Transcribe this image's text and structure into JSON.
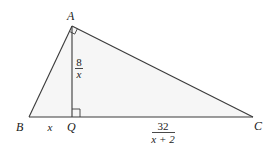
{
  "figure": {
    "type": "right-triangle-with-altitude",
    "vertices": {
      "A": "A",
      "B": "B",
      "C": "C",
      "Q": "Q"
    },
    "segment_labels": {
      "AQ": {
        "numerator": "8",
        "denominator": "x"
      },
      "BQ": "x",
      "QC": {
        "numerator": "32",
        "denominator": "x + 2"
      }
    },
    "right_angles": [
      "A",
      "Q"
    ],
    "colors": {
      "stroke": "#3a3a3a",
      "shade": "#f6f6f6",
      "text": "#1a1a1a"
    }
  }
}
